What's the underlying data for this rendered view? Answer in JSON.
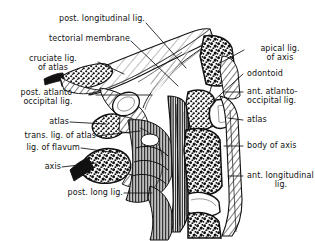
{
  "figure": {
    "ink_color": "#111111",
    "paper_color": "#ffffff"
  },
  "labels_left": [
    {
      "id": "post-longitudinal-lig",
      "text": "post. longitudinal lig.",
      "lines": [
        "post. longitudinal lig."
      ]
    },
    {
      "id": "tectorial-membrane",
      "text": "tectorial membrane",
      "lines": [
        "tectorial membrane"
      ]
    },
    {
      "id": "cruciate-lig-of-atlas",
      "text": "cruciate lig. of atlas",
      "lines": [
        "cruciate lig.",
        "of atlas"
      ]
    },
    {
      "id": "post-atlanto-occipital-lig",
      "text": "post. atlanto-occipital lig.",
      "lines": [
        "post. atlanto-",
        "occipital lig."
      ]
    },
    {
      "id": "atlas-left",
      "text": "atlas",
      "lines": [
        "atlas"
      ]
    },
    {
      "id": "trans-lig-of-atlas",
      "text": "trans. lig. of atlas",
      "lines": [
        "trans. lig. of atlas"
      ]
    },
    {
      "id": "lig-of-flavum",
      "text": "lig. of flavum",
      "lines": [
        "lig. of flavum"
      ]
    },
    {
      "id": "axis",
      "text": "axis",
      "lines": [
        "axis"
      ]
    },
    {
      "id": "post-long-lig",
      "text": "post. long lig.",
      "lines": [
        "post. long lig."
      ]
    }
  ],
  "labels_right": [
    {
      "id": "apical-lig-of-axis",
      "text": "apical lig. of axis",
      "lines": [
        "apical lig.",
        "of axis"
      ]
    },
    {
      "id": "odontoid",
      "text": "odontoid",
      "lines": [
        "odontoid"
      ]
    },
    {
      "id": "ant-atlanto-occipital-lig",
      "text": "ant. atlanto-occipital lig.",
      "lines": [
        "ant. atlanto-",
        "occipital lig."
      ]
    },
    {
      "id": "atlas-right",
      "text": "atlas",
      "lines": [
        "atlas"
      ]
    },
    {
      "id": "body-of-axis",
      "text": "body of axis",
      "lines": [
        "body of axis"
      ]
    },
    {
      "id": "ant-longitudinal-lig",
      "text": "ant. longitudinal lig.",
      "lines": [
        "ant. longitudinal",
        "lig."
      ]
    }
  ]
}
